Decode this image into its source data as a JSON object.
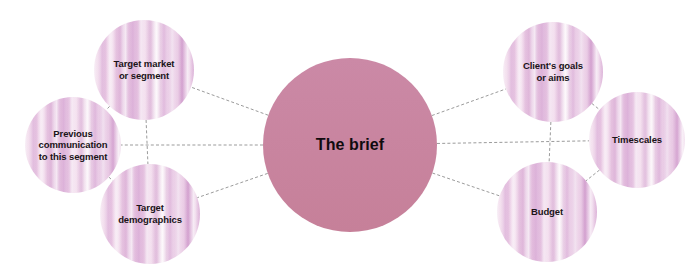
{
  "diagram": {
    "type": "mind-map",
    "title": "The brief",
    "background_color": "#ffffff",
    "hub_color": "#c987a4",
    "satellite_color": "#e0b5d9",
    "connector_color": "#9b9b9b",
    "hub": {
      "id": "the-brief",
      "label": "The brief",
      "cx": 350,
      "cy": 145,
      "r": 87
    },
    "satellites": [
      {
        "id": "target-market",
        "label": "Target market\nor segment",
        "cluster": "left",
        "position": "top",
        "cx": 144,
        "cy": 70,
        "r": 50
      },
      {
        "id": "previous-communication",
        "label": "Previous\ncommunication\nto this segment",
        "cluster": "left",
        "position": "middle",
        "cx": 73,
        "cy": 145,
        "r": 48
      },
      {
        "id": "target-demographics",
        "label": "Target\ndemographics",
        "cluster": "left",
        "position": "bottom",
        "cx": 150,
        "cy": 214,
        "r": 50
      },
      {
        "id": "clients-goals",
        "label": "Client's goals\nor aims",
        "cluster": "right",
        "position": "top",
        "cx": 553,
        "cy": 72,
        "r": 50
      },
      {
        "id": "timescales",
        "label": "Timescales",
        "cluster": "right",
        "position": "middle",
        "cx": 637,
        "cy": 140,
        "r": 48
      },
      {
        "id": "budget",
        "label": "Budget",
        "cluster": "right",
        "position": "bottom",
        "cx": 547,
        "cy": 212,
        "r": 50
      }
    ],
    "connectors": [
      {
        "id": "hub-to-target-market",
        "from": "the-brief",
        "to": "target-market",
        "style": "dashed"
      },
      {
        "id": "hub-to-previous-communication",
        "from": "the-brief",
        "to": "previous-communication",
        "style": "dashed"
      },
      {
        "id": "hub-to-target-demographics",
        "from": "the-brief",
        "to": "target-demographics",
        "style": "dashed"
      },
      {
        "id": "hub-to-clients-goals",
        "from": "the-brief",
        "to": "clients-goals",
        "style": "dashed"
      },
      {
        "id": "hub-to-timescales",
        "from": "the-brief",
        "to": "timescales",
        "style": "dashed"
      },
      {
        "id": "hub-to-budget",
        "from": "the-brief",
        "to": "budget",
        "style": "dashed"
      },
      {
        "id": "target-market-to-target-demographics",
        "from": "target-market",
        "to": "target-demographics",
        "style": "dashed"
      },
      {
        "id": "target-market-to-previous-communication",
        "from": "target-market",
        "to": "previous-communication",
        "style": "dashed"
      },
      {
        "id": "previous-communication-to-target-demographics",
        "from": "previous-communication",
        "to": "target-demographics",
        "style": "dashed"
      },
      {
        "id": "clients-goals-to-budget",
        "from": "clients-goals",
        "to": "budget",
        "style": "dashed"
      },
      {
        "id": "clients-goals-to-timescales",
        "from": "clients-goals",
        "to": "timescales",
        "style": "dashed"
      },
      {
        "id": "timescales-to-budget",
        "from": "timescales",
        "to": "budget",
        "style": "dashed"
      }
    ]
  }
}
